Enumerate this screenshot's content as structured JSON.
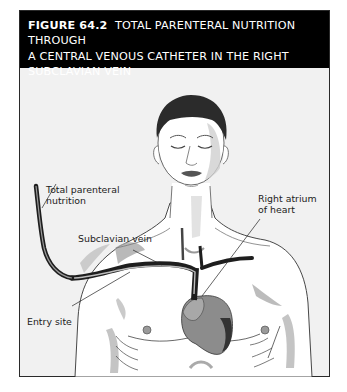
{
  "figure": {
    "number": "FIGURE 64.2",
    "title": "TOTAL PARENTERAL NUTRITION THROUGH A CENTRAL VENOUS CATHETER IN THE RIGHT SUBCLAVIAN VEIN",
    "title_lines": [
      "TOTAL PARENTERAL NUTRITION THROUGH",
      "A CENTRAL VENOUS CATHETER IN THE RIGHT",
      "SUBCLAVIAN VEIN"
    ]
  },
  "labels": {
    "tpn_line1": "Total parenteral",
    "tpn_line2": "nutrition",
    "subclavian_vein": "Subclavian vein",
    "right_atrium_line1": "Right atrium",
    "right_atrium_line2": "of heart",
    "entry_site": "Entry site"
  },
  "colors": {
    "header_bg": "#000000",
    "header_text": "#ffffff",
    "panel_bg": "#f1f1f1",
    "hair": "#2b2b2b",
    "skin": "#ffffff",
    "shadow": "#9a9a9a",
    "heart": "#8a8a8a",
    "vein": "#1e1e1e"
  }
}
